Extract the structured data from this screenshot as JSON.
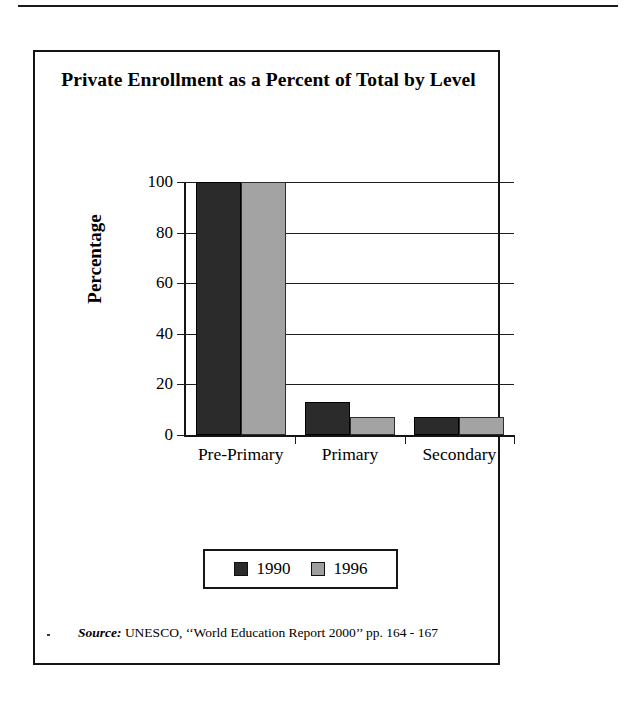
{
  "page": {
    "top_rule": "horizontal-rule"
  },
  "figure": {
    "title": "Private Enrollment as a Percent of Total by Level",
    "source": {
      "label": "Source:",
      "text": "UNESCO, ‘‘World Education Report 2000’’ pp. 164 - 167"
    }
  },
  "legend": {
    "position": "bottom-center",
    "entries": [
      {
        "label": "1990",
        "color": "#2b2b2b"
      },
      {
        "label": "1996",
        "color": "#9e9e9e"
      }
    ]
  },
  "colors": {
    "series_1990": "#2b2b2b",
    "series_1996": "#a3a3a3",
    "axis": "#141414",
    "background": "#ffffff"
  },
  "chart_data": {
    "type": "bar",
    "title": "Private Enrollment as a Percent of Total by Level",
    "xlabel": "",
    "ylabel": "Percentage",
    "categories": [
      "Pre-Primary",
      "Primary",
      "Secondary"
    ],
    "series": [
      {
        "name": "1990",
        "values": [
          100,
          13,
          7
        ],
        "color": "#2b2b2b"
      },
      {
        "name": "1996",
        "values": [
          100,
          7,
          7
        ],
        "color": "#a3a3a3"
      }
    ],
    "ylim": [
      0,
      100
    ],
    "yticks": [
      0,
      20,
      40,
      60,
      80,
      100
    ],
    "ytick_labels": [
      "0",
      "20",
      "40",
      "60",
      "80",
      "100"
    ],
    "grid": true,
    "grid_axis": "y",
    "legend_position": "bottom",
    "annotations": [
      "Source: UNESCO, ‘‘World Education Report 2000’’ pp. 164 - 167"
    ]
  }
}
